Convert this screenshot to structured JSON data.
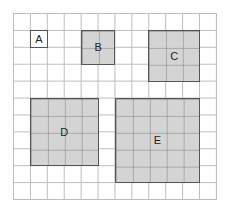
{
  "diagram": {
    "grid": {
      "columns": 12,
      "rows": 11,
      "line_color": "#bdbdbd"
    },
    "fill_color": "#d4d4d4",
    "border_color": "#555555",
    "shapes": [
      {
        "label": "A",
        "col": 1,
        "row": 1,
        "size": 1,
        "fill": "white"
      },
      {
        "label": "B",
        "col": 4,
        "row": 1,
        "size": 2,
        "fill": "gray"
      },
      {
        "label": "C",
        "col": 8,
        "row": 1,
        "size": 3,
        "fill": "gray"
      },
      {
        "label": "D",
        "col": 1,
        "row": 5,
        "size": 4,
        "fill": "gray"
      },
      {
        "label": "E",
        "col": 6,
        "row": 5,
        "size": 5,
        "fill": "gray"
      }
    ]
  }
}
